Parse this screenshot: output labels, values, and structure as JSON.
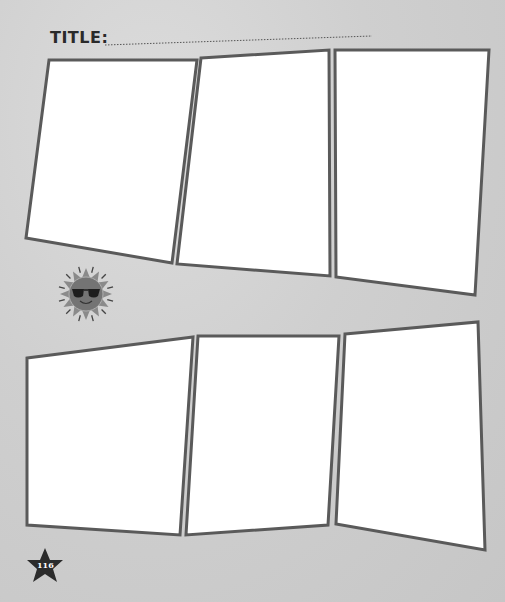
{
  "page": {
    "title_label": "TITLE:",
    "title_value": "",
    "page_number": "116"
  },
  "panels": {
    "top_row": [
      {
        "id": "panel-1",
        "points": "49,60 197,60 172,263 26,238"
      },
      {
        "id": "panel-2",
        "points": "201,58 329,50 330,276 177,264"
      },
      {
        "id": "panel-3",
        "points": "335,50 489,50 475,295 336,277"
      }
    ],
    "bottom_row": [
      {
        "id": "panel-4",
        "points": "27,358 193,337 180,535 27,525"
      },
      {
        "id": "panel-5",
        "points": "198,336 339,336 328,525 186,535"
      },
      {
        "id": "panel-6",
        "points": "345,334 478,322 485,550 336,524"
      }
    ]
  },
  "decorations": {
    "sun_icon": "sun-with-sunglasses",
    "star_badge": "star-icon"
  },
  "colors": {
    "panel_border": "#5a5a5a",
    "panel_fill": "#ffffff",
    "sun_body": "#7a7a7a",
    "star": "#2b2b2b"
  }
}
